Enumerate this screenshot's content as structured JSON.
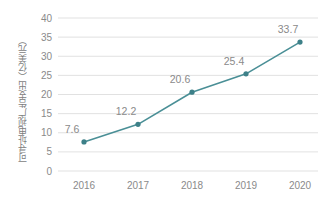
{
  "chart_data": {
    "type": "line",
    "title": "",
    "xlabel": "",
    "ylabel": "可寻址电视广告支出（亿美元）",
    "categories": [
      "2016",
      "2017",
      "2018",
      "2019",
      "2020"
    ],
    "values": [
      7.6,
      12.2,
      20.6,
      25.4,
      33.7
    ],
    "point_labels": [
      "7.6",
      "12.2",
      "20.6",
      "25.4",
      "33.7"
    ],
    "ylim": [
      0,
      40
    ],
    "yticks": [
      0,
      5,
      10,
      15,
      20,
      25,
      30,
      35,
      40
    ],
    "ytick_labels": [
      "0",
      "5",
      "10",
      "15",
      "20",
      "25",
      "30",
      "35",
      "40"
    ],
    "grid": "horizontal",
    "legend": "none",
    "series": [
      {
        "name": "可寻址电视广告支出",
        "values": [
          7.6,
          12.2,
          20.6,
          25.4,
          33.7
        ]
      }
    ],
    "colors": {
      "line": "#4a8f96",
      "marker": "#3d8088",
      "grid": "#d9d9d9",
      "text": "#8a8a8a",
      "background": "#ffffff"
    }
  }
}
